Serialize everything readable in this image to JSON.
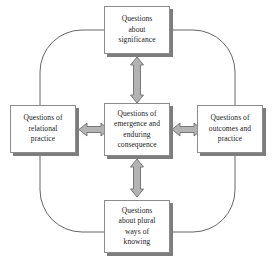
{
  "diagram": {
    "colors": {
      "box_border": "#8c8c8c",
      "box_fill": "#ffffff",
      "box_shadow": "#7d7d7d",
      "arrow_fill": "#b3b3b3",
      "arrow_stroke": "#6e6e6e",
      "ring_stroke": "#555555",
      "text": "#1a1a1a"
    },
    "nodes": [
      {
        "id": "top",
        "label": "Questions\nabout\nsignificance"
      },
      {
        "id": "left",
        "label": "Questions of\nrelational\npractice"
      },
      {
        "id": "center",
        "label": "Questions of\nemergence and\nenduring\nconsequence"
      },
      {
        "id": "right",
        "label": "Questions of\noutcomes and\npractice"
      },
      {
        "id": "bottom",
        "label": "Questions\nabout plural\nways of\nknowing"
      }
    ],
    "connectors": [
      {
        "id": "center-top",
        "from": "center",
        "to": "top",
        "style": "double-headed-arrow",
        "orientation": "vertical"
      },
      {
        "id": "center-left",
        "from": "center",
        "to": "left",
        "style": "double-headed-arrow",
        "orientation": "horizontal"
      },
      {
        "id": "center-right",
        "from": "center",
        "to": "right",
        "style": "double-headed-arrow",
        "orientation": "horizontal"
      },
      {
        "id": "center-bottom",
        "from": "center",
        "to": "bottom",
        "style": "double-headed-arrow",
        "orientation": "vertical"
      }
    ],
    "ring": {
      "style": "rounded-rectangle-outline",
      "note": "thin line linking the four outer boxes"
    }
  }
}
